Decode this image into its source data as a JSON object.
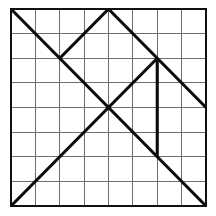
{
  "figure": {
    "type": "line-drawing",
    "canvas": {
      "width": 216,
      "height": 216,
      "background": "#ffffff"
    },
    "grid": {
      "columns": 8,
      "rows": 8,
      "x_min": 11,
      "y_min": 9,
      "x_max": 206,
      "y_max": 206,
      "cell_width": 24.375,
      "cell_height": 24.625,
      "line_color": "#6e6e6e",
      "line_width": 1,
      "border_color": "#101010",
      "border_width": 2.4
    },
    "segments": {
      "color": "#0b0b0b",
      "width": 3.1,
      "items": [
        {
          "name": "main-diagonal",
          "x1": 0,
          "y1": 0,
          "x2": 8,
          "y2": 8
        },
        {
          "name": "anti-diagonal-lower-left",
          "x1": 0,
          "y1": 8,
          "x2": 4,
          "y2": 4
        },
        {
          "name": "anti-diagonal-upper-left",
          "x1": 4,
          "y1": 4,
          "x2": 6,
          "y2": 2
        },
        {
          "name": "apex-left-leg",
          "x1": 4,
          "y1": 0,
          "x2": 2,
          "y2": 2
        },
        {
          "name": "apex-right-leg",
          "x1": 4,
          "y1": 0,
          "x2": 8,
          "y2": 4
        },
        {
          "name": "vertical-segment",
          "x1": 6,
          "y1": 2,
          "x2": 6,
          "y2": 6
        }
      ]
    }
  }
}
